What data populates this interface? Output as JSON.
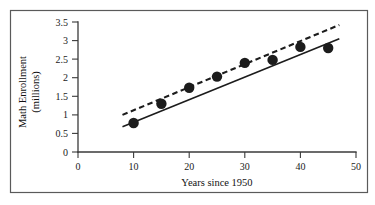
{
  "chart_data": {
    "type": "scatter",
    "title": "",
    "xlabel": "Years since 1950",
    "ylabel": "Math Enrollment (millions)",
    "ylabel_line1": "Math Enrollment",
    "ylabel_line2": "(millions)",
    "xlim": [
      0,
      50
    ],
    "ylim": [
      0,
      3.5
    ],
    "xticks": [
      "0",
      "10",
      "20",
      "30",
      "40",
      "50"
    ],
    "xtick_values": [
      0,
      10,
      20,
      30,
      40,
      50
    ],
    "yticks": [
      "0",
      "0.5",
      "1",
      "1.5",
      "2",
      "2.5",
      "3",
      "3.5"
    ],
    "ytick_values": [
      0,
      0.5,
      1,
      1.5,
      2,
      2.5,
      3,
      3.5
    ],
    "grid": false,
    "legend": "none",
    "points": [
      {
        "x": 10,
        "y": 0.78
      },
      {
        "x": 15,
        "y": 1.3
      },
      {
        "x": 20,
        "y": 1.73
      },
      {
        "x": 25,
        "y": 2.03
      },
      {
        "x": 30,
        "y": 2.4
      },
      {
        "x": 35,
        "y": 2.48
      },
      {
        "x": 40,
        "y": 2.83
      },
      {
        "x": 45,
        "y": 2.8
      }
    ],
    "series": [
      {
        "name": "Least-squares line (solid)",
        "style": "solid",
        "x": [
          8,
          47
        ],
        "y": [
          0.68,
          3.05
        ]
      },
      {
        "name": "Alternative fit line (dashed)",
        "style": "dashed",
        "x": [
          8,
          47
        ],
        "y": [
          1.0,
          3.42
        ]
      }
    ],
    "marker": {
      "shape": "circle",
      "color": "#1c1c1c",
      "radius": 5.2
    },
    "colors": {
      "line_solid": "#1c1c1c",
      "line_dashed": "#1c1c1c",
      "axis": "#3a3a3a",
      "frame": "#5a5a5a",
      "background": "#ffffff"
    }
  }
}
